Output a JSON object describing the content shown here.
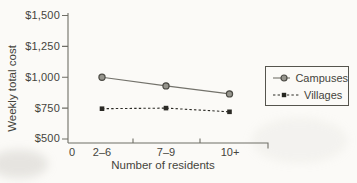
{
  "chart_data": {
    "type": "line",
    "title": "",
    "xlabel": "Number of residents",
    "ylabel": "Weekly total cost",
    "x_origin_label": "0",
    "categories": [
      "2–6",
      "7–9",
      "10+"
    ],
    "y_tick_labels": [
      "$1,500",
      "$1,250",
      "$1,000",
      "$750",
      "$500"
    ],
    "y_tick_values": [
      1500,
      1250,
      1000,
      750,
      500
    ],
    "ylim": [
      500,
      1500
    ],
    "grid": false,
    "legend_position": "right-middle",
    "series": [
      {
        "name": "Campuses",
        "line_style": "solid",
        "marker": "circle-open",
        "values": [
          1000,
          930,
          865
        ]
      },
      {
        "name": "Villages",
        "line_style": "dashed",
        "marker": "square-filled",
        "values": [
          745,
          750,
          720
        ]
      }
    ]
  },
  "colors": {
    "background": "#fbfaf7",
    "text": "#45443c",
    "axis": "#6f6e66",
    "campuses_line": "#73726b",
    "campuses_marker_fill": "#96958d",
    "campuses_marker_stroke": "#4c4b45",
    "villages_line": "#2b2a25",
    "legend_border": "#55544d"
  }
}
